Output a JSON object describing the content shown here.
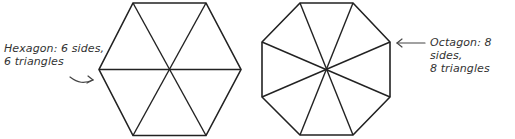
{
  "diagram": {
    "hexagon": {
      "label_line1": "Hexagon: 6 sides,",
      "label_line2": "6 triangles",
      "sides": 6,
      "triangles": 6
    },
    "octagon": {
      "label_line1": "Octagon: 8 sides,",
      "label_line2": "8 triangles",
      "sides": 8,
      "triangles": 8
    },
    "colors": {
      "stroke": "#222222",
      "annotation": "#333333",
      "background": "#ffffff"
    }
  }
}
